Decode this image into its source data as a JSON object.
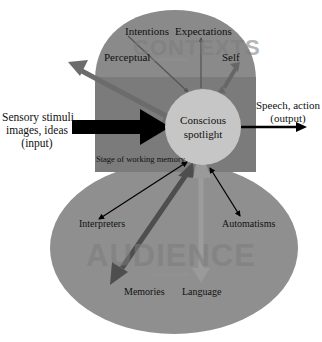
{
  "diagram": {
    "type": "global-workspace-theatre",
    "regions": {
      "contexts": {
        "watermark": "CONTEXTS",
        "subtitle": "(unconscious)"
      },
      "working_memory": {
        "label": "Stage of working memory"
      },
      "spotlight": {
        "line1": "Conscious",
        "line2": "spotlight"
      },
      "audience": {
        "watermark": "AUDIENCE",
        "subtitle": "(unconscious)"
      }
    },
    "input": {
      "line1": "Sensory stimuli,",
      "line2": "images, ideas",
      "line3": "(input)"
    },
    "output": {
      "line1": "Speech, action",
      "line2": "(output)"
    },
    "context_nodes": [
      {
        "label": "Intentions"
      },
      {
        "label": "Expectations"
      },
      {
        "label": "Perceptual"
      },
      {
        "label": "Self"
      }
    ],
    "audience_nodes": [
      {
        "label": "Interpreters"
      },
      {
        "label": "Automatisms"
      },
      {
        "label": "Memories"
      },
      {
        "label": "Language"
      }
    ],
    "colors": {
      "contexts_fill": "#8a8a8a",
      "band_fill": "#7b7b7b",
      "audience_fill": "#8f8f8f",
      "spotlight_fill": "#c6c6c6",
      "dark_arrow": "#4e4e4e",
      "mid_arrow": "#6c6c6c",
      "light_arrow": "#9c9c9c",
      "black": "#000000"
    }
  }
}
